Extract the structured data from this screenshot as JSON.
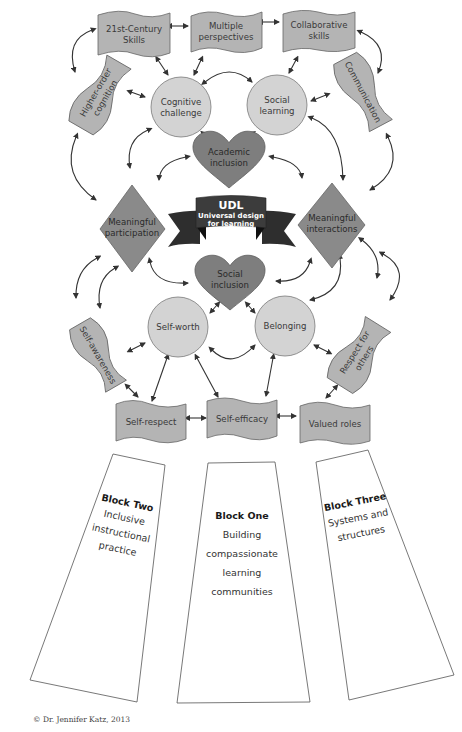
{
  "diagram": {
    "top_banners": [
      {
        "lines": [
          "21st-Century",
          "Skills"
        ]
      },
      {
        "lines": [
          "Multiple",
          "perspectives"
        ]
      },
      {
        "lines": [
          "Collaborative",
          "skills"
        ]
      }
    ],
    "side_banners": {
      "higher_order": {
        "lines": [
          "Higher-order",
          "cognition"
        ]
      },
      "communication": {
        "lines": [
          "Communication"
        ]
      },
      "self_awareness": {
        "lines": [
          "Self-awareness"
        ]
      },
      "respect_others": {
        "lines": [
          "Respect for",
          "others"
        ]
      }
    },
    "circles": {
      "cognitive": {
        "lines": [
          "Cognitive",
          "challenge"
        ]
      },
      "social_learning": {
        "lines": [
          "Social",
          "learning"
        ]
      },
      "self_worth": {
        "lines": [
          "Self-worth"
        ]
      },
      "belonging": {
        "lines": [
          "Belonging"
        ]
      }
    },
    "hearts": {
      "academic": {
        "lines": [
          "Academic",
          "inclusion"
        ]
      },
      "social": {
        "lines": [
          "Social",
          "inclusion"
        ]
      }
    },
    "diamonds": {
      "participation": {
        "lines": [
          "Meaningful",
          "participation"
        ]
      },
      "interactions": {
        "lines": [
          "Meaningful",
          "interactions"
        ]
      }
    },
    "udl": {
      "title": "UDL",
      "subtitle_lines": [
        "Universal design",
        "for learning"
      ]
    },
    "bottom_banners": [
      {
        "lines": [
          "Self-respect"
        ]
      },
      {
        "lines": [
          "Self-efficacy"
        ]
      },
      {
        "lines": [
          "Valued roles"
        ]
      }
    ],
    "blocks": [
      {
        "title": "Block Two",
        "lines": [
          "Inclusive",
          "instructional",
          "practice"
        ]
      },
      {
        "title": "Block One",
        "lines": [
          "Building",
          "compassionate",
          "learning",
          "communities"
        ]
      },
      {
        "title": "Block Three",
        "lines": [
          "Systems and",
          "structures"
        ]
      }
    ],
    "credit": "© Dr. Jennifer Katz, 2013",
    "colors": {
      "banner": "#b4b4b4",
      "circle": "#d3d3d3",
      "heart": "#7e7e7e",
      "diamond": "#8a8a8a",
      "udl_ribbon": "#3c3c3c",
      "arrow": "#333333"
    }
  }
}
